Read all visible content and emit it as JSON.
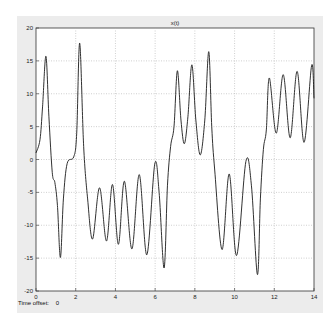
{
  "window": {
    "panel_color": "#ececec",
    "axes_color": "#ffffff",
    "line_color": "#1a1a1a",
    "grid_color": "#b0b0b0"
  },
  "footer": {
    "time_offset_label": "Time offset:",
    "time_offset_value": "0"
  },
  "chart_data": {
    "type": "line",
    "title": "x(t)",
    "xlabel": "",
    "ylabel": "",
    "xlim": [
      0,
      14
    ],
    "ylim": [
      -20,
      20
    ],
    "grid": true,
    "legend": "none",
    "x_ticks": [
      0,
      2,
      4,
      6,
      8,
      10,
      12,
      14
    ],
    "y_ticks": [
      -20,
      -15,
      -10,
      -5,
      0,
      5,
      10,
      15,
      20
    ],
    "series": [
      {
        "name": "x(t)",
        "x": [
          0,
          0.2,
          0.33,
          0.5,
          0.65,
          0.82,
          0.95,
          1.08,
          1.23,
          1.38,
          1.57,
          1.9,
          2.05,
          2.2,
          2.4,
          2.6,
          2.85,
          3.2,
          3.55,
          3.85,
          4.15,
          4.45,
          4.83,
          5.2,
          5.58,
          5.98,
          6.2,
          6.45,
          6.62,
          6.78,
          6.95,
          7.12,
          7.3,
          7.47,
          7.65,
          7.85,
          8.05,
          8.27,
          8.5,
          8.7,
          8.85,
          9.0,
          9.37,
          9.73,
          10.1,
          10.57,
          10.85,
          11.15,
          11.3,
          11.45,
          11.6,
          11.75,
          12.1,
          12.45,
          12.8,
          13.15,
          13.5,
          13.88,
          14.0
        ],
        "values": [
          1.0,
          3.0,
          8.0,
          15.7,
          6.5,
          -2.0,
          -3.5,
          -7.0,
          -14.9,
          -6.0,
          -0.6,
          0.4,
          4.0,
          17.7,
          2.0,
          -6.0,
          -12.1,
          -4.3,
          -12.4,
          -3.8,
          -12.9,
          -3.3,
          -13.6,
          -2.3,
          -14.5,
          -0.7,
          -5.0,
          -16.5,
          -4.0,
          2.0,
          5.0,
          13.5,
          6.0,
          2.4,
          6.5,
          14.4,
          6.0,
          0.7,
          6.0,
          16.4,
          5.0,
          -1.6,
          -13.7,
          -2.2,
          -14.6,
          -0.3,
          -4.0,
          -17.5,
          -6.0,
          1.5,
          4.5,
          12.4,
          4.0,
          12.9,
          3.3,
          13.4,
          2.6,
          14.3,
          9.3
        ]
      }
    ]
  }
}
